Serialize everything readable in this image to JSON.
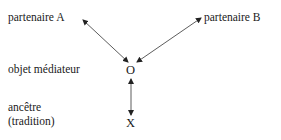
{
  "diagram": {
    "nodes": {
      "partner_a": "partenaire A",
      "partner_b": "partenaire B",
      "mediator_label": "objet médiateur",
      "mediator_symbol": "O",
      "ancestor_label_line1": "ancêtre",
      "ancestor_label_line2": "(tradition)",
      "ancestor_symbol": "X"
    },
    "edges": [
      {
        "from": "partenaire A",
        "to": "O",
        "direction": "both"
      },
      {
        "from": "O",
        "to": "partenaire B",
        "direction": "both"
      },
      {
        "from": "O",
        "to": "X",
        "direction": "both"
      }
    ]
  }
}
